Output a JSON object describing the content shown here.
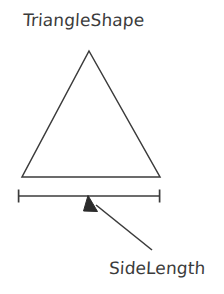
{
  "diagram": {
    "title_label": "TriangleShape",
    "dimension_label": "SideLength",
    "stroke_color": "#3b3b3b",
    "background_color": "#ffffff",
    "shape": {
      "name": "triangle",
      "apex": [
        89,
        51
      ],
      "base_left": [
        22,
        177
      ],
      "base_right": [
        160,
        177
      ],
      "filled": false
    },
    "dimension_line": {
      "y": 196,
      "x_start": 18,
      "x_end": 160,
      "tick_half_height": 6.5
    },
    "callout_arrow": {
      "tip": [
        88,
        196
      ],
      "tail": [
        152,
        250
      ],
      "arrowhead_filled": true
    }
  }
}
